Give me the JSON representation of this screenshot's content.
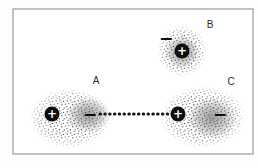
{
  "diagram": {
    "colors": {
      "background": "#fdfdfc",
      "frame": "#9b9b9b",
      "stipple": "#585858",
      "charge": "#0d0d0d",
      "dotted_line": "#151515"
    },
    "molecules": [
      {
        "label": "A",
        "charges": [
          {
            "sign": "+"
          },
          {
            "sign": "−"
          }
        ]
      },
      {
        "label": "B",
        "charges": [
          {
            "sign": "−"
          },
          {
            "sign": "+"
          }
        ]
      },
      {
        "label": "C",
        "charges": [
          {
            "sign": "+"
          },
          {
            "sign": "−"
          }
        ]
      }
    ],
    "attraction_line": {
      "style": "dotted",
      "between": [
        "A",
        "C"
      ]
    }
  }
}
